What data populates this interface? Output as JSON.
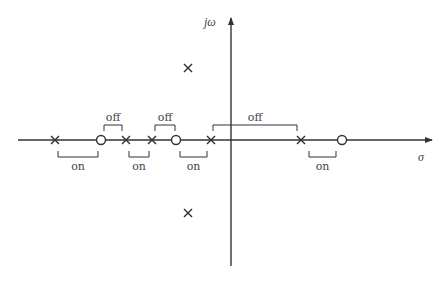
{
  "diagram": {
    "title": "",
    "axes": {
      "real_label": "σ",
      "imag_label": "jω",
      "origin_px": [
        231,
        140
      ],
      "real_axis_px": [
        18,
        432
      ],
      "imag_axis_px": [
        18,
        266
      ]
    },
    "poles_real_px": [
      55,
      126,
      152,
      211,
      301
    ],
    "zeros_real_px": [
      101,
      176,
      342
    ],
    "complex_poles_px": [
      [
        188,
        68
      ],
      [
        188,
        213
      ]
    ],
    "segments": [
      {
        "state": "on",
        "from": 58,
        "to": 98,
        "side": "below",
        "label": "on"
      },
      {
        "state": "off",
        "from": 104,
        "to": 122,
        "side": "above",
        "label": "off"
      },
      {
        "state": "on",
        "from": 129,
        "to": 149,
        "side": "below",
        "label": "on"
      },
      {
        "state": "off",
        "from": 155,
        "to": 175,
        "side": "above",
        "label": "off"
      },
      {
        "state": "on",
        "from": 180,
        "to": 207,
        "side": "below",
        "label": "on"
      },
      {
        "state": "off",
        "from": 213,
        "to": 297,
        "side": "above",
        "label": "off"
      },
      {
        "state": "on",
        "from": 309,
        "to": 336,
        "side": "below",
        "label": "on"
      }
    ],
    "colors": {
      "stroke": "#333333",
      "text": "#444444"
    }
  }
}
